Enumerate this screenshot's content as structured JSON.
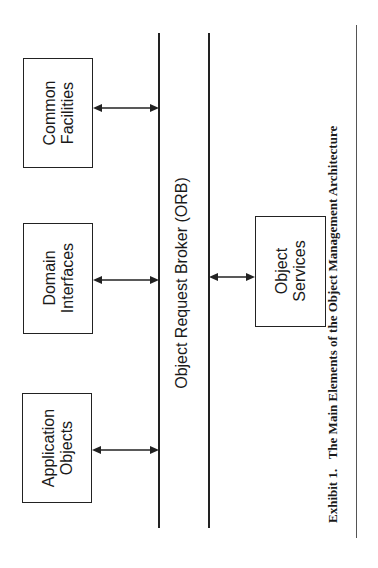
{
  "diagram": {
    "orb_label": "Object Request Broker (ORB)",
    "boxes": [
      {
        "id": "common-facilities",
        "line1": "Common",
        "line2": "Facilities",
        "side": "left"
      },
      {
        "id": "domain-interfaces",
        "line1": "Domain",
        "line2": "Interfaces",
        "side": "left"
      },
      {
        "id": "application-objects",
        "line1": "Application",
        "line2": "Objects",
        "side": "left"
      },
      {
        "id": "object-services",
        "line1": "Object",
        "line2": "Services",
        "side": "right"
      }
    ],
    "caption_label": "Exhibit 1.",
    "caption_title": "The Main Elements of the Object Management Architecture"
  }
}
